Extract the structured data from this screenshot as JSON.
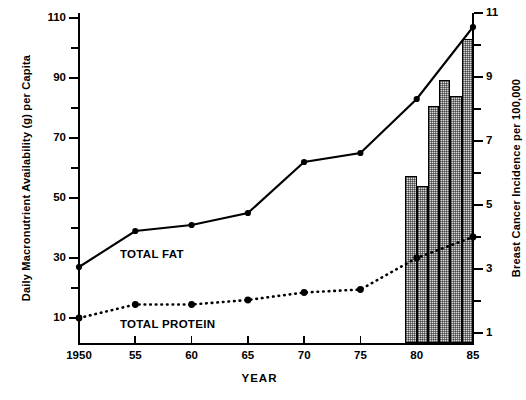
{
  "chart_data": {
    "type": "line",
    "title": "",
    "xlabel": "YEAR",
    "ylabel": "Daily Macronutrient Availability (g) per Capita",
    "ylabel_right": "Breast Cancer Incidence per 100,000",
    "x": [
      1950,
      1955,
      1960,
      1965,
      1970,
      1975,
      1980,
      1985
    ],
    "xtick_labels": [
      "1950",
      "55",
      "60",
      "65",
      "70",
      "75",
      "80",
      "85"
    ],
    "ylim": [
      0,
      110
    ],
    "ytick_labels_left": [
      "110",
      "90",
      "70",
      "50",
      "30",
      "10"
    ],
    "ytick_values_left": [
      110,
      90,
      70,
      50,
      30,
      10
    ],
    "yminor_values_left": [
      100,
      80,
      60,
      40,
      20
    ],
    "ylim_right": [
      0,
      11
    ],
    "ytick_labels_right": [
      "11",
      "9",
      "7",
      "5",
      "3",
      "1"
    ],
    "ytick_values_right": [
      11,
      9,
      7,
      5,
      3,
      1
    ],
    "yminor_values_right": [
      10,
      8,
      6,
      4,
      2
    ],
    "grid": false,
    "legend": "inline-annotations",
    "series": [
      {
        "name": "TOTAL FAT",
        "style": "solid-line-with-markers",
        "axis": "left",
        "values": [
          27,
          39,
          41,
          45,
          62,
          65,
          83,
          107
        ]
      },
      {
        "name": "TOTAL PROTEIN",
        "style": "dotted-line-with-markers",
        "axis": "left",
        "values": [
          10,
          14.5,
          14.5,
          16,
          18.5,
          19.5,
          30,
          37
        ]
      },
      {
        "name": "Breast Cancer Incidence",
        "style": "bars",
        "axis": "right",
        "bar_years": [
          1979,
          1980,
          1981,
          1982,
          1983,
          1984
        ],
        "bar_values": [
          5.9,
          5.6,
          8.1,
          8.9,
          8.4,
          10.2
        ]
      }
    ],
    "annotations": [
      {
        "text": "TOTAL FAT",
        "x": 1957,
        "y": 31
      },
      {
        "text": "TOTAL PROTEIN",
        "x": 1957,
        "y": 8
      }
    ]
  },
  "axes": {
    "left_title": "Daily Macronutrient Availability (g) per Capita",
    "right_title": "Breast Cancer Incidence per 100,000",
    "x_title": "YEAR"
  },
  "labels": {
    "fat": "TOTAL FAT",
    "protein": "TOTAL PROTEIN"
  },
  "colors": {
    "line": "#000000",
    "bar_fill": "#d8d8d8",
    "bar_edge": "#000000",
    "background": "#ffffff"
  }
}
